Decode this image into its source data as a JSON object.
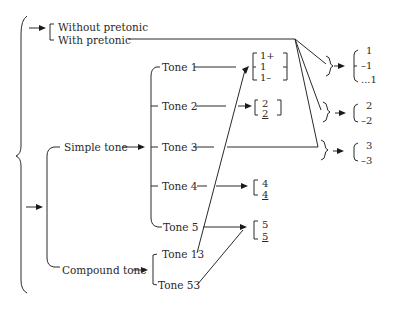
{
  "diagram": {
    "type": "tone-system-tree",
    "root_options": {
      "pretonic": [
        "Without pretonic",
        "With pretonic"
      ],
      "tonic": {
        "simple_label": "Simple tone",
        "compound_label": "Compound tone",
        "simple_tones": [
          "Tone 1",
          "Tone 2",
          "Tone 3",
          "Tone 4",
          "Tone 5"
        ],
        "compound_tones": [
          "Tone 13",
          "Tone 53"
        ]
      }
    },
    "secondary_sets": {
      "tone1": [
        "1+",
        "1",
        "1–"
      ],
      "tone2": [
        "2",
        "2"
      ],
      "tone4": [
        "4",
        "4"
      ],
      "tone5": [
        "5",
        "5"
      ]
    },
    "pretonic_results": {
      "tone1": [
        "1",
        "–1",
        "...1"
      ],
      "tone2": [
        "2",
        "–2"
      ],
      "tone3": [
        "3",
        "–3"
      ]
    },
    "colors": {
      "ink": "#2a2a2a",
      "background": "#ffffff"
    }
  }
}
